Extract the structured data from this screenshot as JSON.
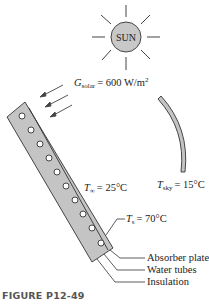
{
  "sun": {
    "label": "SUN",
    "fill": "#c8c8c8"
  },
  "solar": {
    "symbol": "G",
    "subscript": "solar",
    "value": "= 600 W/m",
    "sup": "2"
  },
  "ambient": {
    "symbol": "T",
    "subscript": "∞",
    "value": "= 25°C"
  },
  "sky": {
    "symbol": "T",
    "subscript": "sky",
    "value": "= 15°C"
  },
  "surface": {
    "symbol": "T",
    "subscript": "s",
    "value": "= 70°C"
  },
  "callouts": {
    "absorber": "Absorber plate",
    "tubes": "Water tubes",
    "insulation": "Insulation"
  },
  "caption": "FIGURE P12-49",
  "colors": {
    "panel": "#c4c4c4",
    "stroke": "#333333",
    "sky_arc": "#c4c4c4"
  }
}
